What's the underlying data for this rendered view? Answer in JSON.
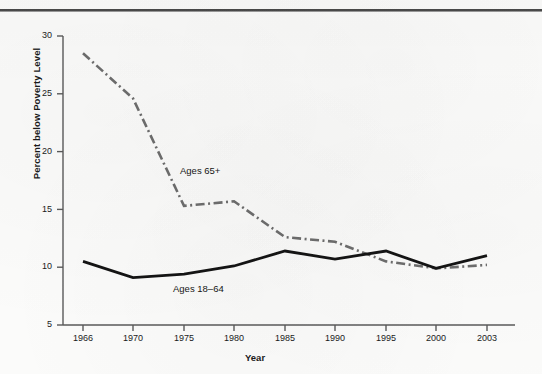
{
  "figure": {
    "background_color": "#fbfbfa",
    "has_top_rule": true,
    "ink_color": "#1a1a1a",
    "dashed_series_color": "#6d6d6d"
  },
  "axes": {
    "ylabel": "Percent below Poverty Level",
    "xlabel": "Year",
    "yticks": [
      "30",
      "25",
      "20",
      "15",
      "10",
      "5"
    ],
    "xticks": [
      "1966",
      "1970",
      "1975",
      "1980",
      "1985",
      "1990",
      "1995",
      "2000",
      "2003"
    ]
  },
  "annotations": {
    "older_label": "Ages 65+",
    "working_label": "Ages 18–64"
  },
  "chart_data": {
    "type": "line",
    "title": "",
    "xlabel": "Year",
    "ylabel": "Percent below Poverty Level",
    "x": [
      1966,
      1970,
      1975,
      1980,
      1985,
      1990,
      1995,
      2000,
      2003
    ],
    "xtick_labels": [
      "1966",
      "1970",
      "1975",
      "1980",
      "1985",
      "1990",
      "1995",
      "2000",
      "2003"
    ],
    "ylim": [
      5,
      30
    ],
    "yticks": [
      5,
      10,
      15,
      20,
      25,
      30
    ],
    "grid": false,
    "legend_position": "inline-annotation",
    "series": [
      {
        "name": "Ages 65+",
        "style": "dash-dot",
        "color": "#6d6d6d",
        "values": [
          28.5,
          24.6,
          15.3,
          15.7,
          12.6,
          12.2,
          10.5,
          9.9,
          10.2
        ]
      },
      {
        "name": "Ages 18–64",
        "style": "solid",
        "color": "#141414",
        "values": [
          10.5,
          9.1,
          9.4,
          10.1,
          11.4,
          10.7,
          11.4,
          9.9,
          11.0
        ]
      }
    ]
  }
}
